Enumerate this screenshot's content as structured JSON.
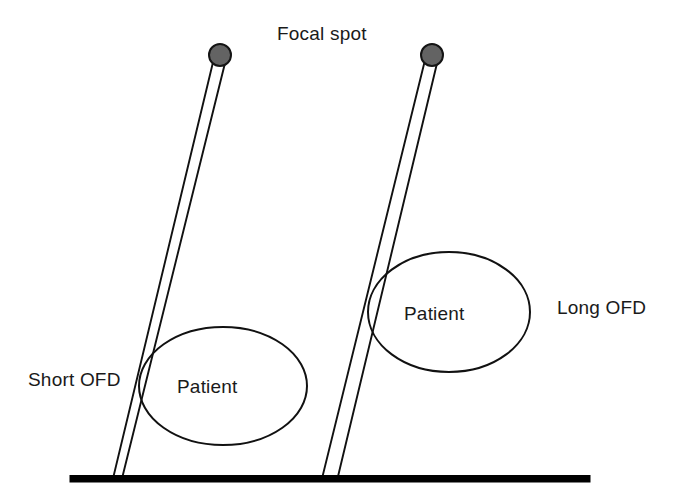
{
  "diagram": {
    "title_label": "Focal spot",
    "labels": {
      "focal_spot": "Focal spot",
      "short_ofd": "Short OFD",
      "long_ofd": "Long OFD",
      "patient_left": "Patient",
      "patient_right": "Patient"
    },
    "colors": {
      "focal_spot_fill": "#636363",
      "focal_spot_stroke": "#141414",
      "line_stroke": "#111111",
      "baseline_fill": "#000000",
      "background": "#ffffff",
      "text": "#1a1a1a"
    },
    "geometry": {
      "canvas": {
        "width": 681,
        "height": 503
      },
      "baseline": {
        "x1": 70,
        "x2": 590,
        "y": 476,
        "thickness": 7
      },
      "focal_spots": [
        {
          "name": "left",
          "cx": 220,
          "cy": 55,
          "r": 11
        },
        {
          "name": "right",
          "cx": 432,
          "cy": 55,
          "r": 11
        }
      ],
      "beams": [
        {
          "name": "short-ofd-beam",
          "apex_x": 220,
          "apex_y": 62,
          "base_left_x": 113,
          "base_right_x": 122,
          "base_y": 478,
          "waist_width": 9
        },
        {
          "name": "long-ofd-beam",
          "apex_x": 432,
          "apex_y": 62,
          "base_left_x": 322,
          "base_right_x": 337,
          "base_y": 478,
          "waist_width": 15
        }
      ],
      "patients": [
        {
          "name": "left",
          "cx": 223,
          "cy": 386,
          "rx": 84,
          "ry": 59
        },
        {
          "name": "right",
          "cx": 449,
          "cy": 312,
          "rx": 81,
          "ry": 60
        }
      ],
      "label_positions": {
        "focal_spot": {
          "x": 277,
          "y": 40
        },
        "short_ofd": {
          "x": 28,
          "y": 386
        },
        "long_ofd": {
          "x": 557,
          "y": 314
        },
        "patient_left": {
          "x": 177,
          "y": 393
        },
        "patient_right": {
          "x": 404,
          "y": 320
        }
      }
    }
  }
}
